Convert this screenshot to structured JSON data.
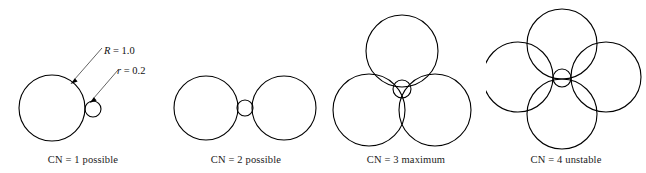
{
  "figure": {
    "background_color": "#ffffff",
    "stroke_color": "#000000",
    "leader_color": "#3c3c3c"
  },
  "annotations": {
    "radius_large": {
      "symbol": "R",
      "equals": " = 1.0",
      "full": "R = 1.0"
    },
    "radius_small": {
      "symbol": "r",
      "equals": " = 0.2",
      "full": "r = 0.2"
    }
  },
  "panels": [
    {
      "id": "cn1",
      "caption": "CN = 1 possible",
      "cn": 1,
      "status": "possible",
      "large_circles": [
        {
          "cx": 52,
          "cy": 108,
          "r": 33
        }
      ],
      "small_circles": [
        {
          "cx": 93,
          "cy": 109,
          "r": 8
        }
      ]
    },
    {
      "id": "cn2",
      "caption": "CN = 2 possible",
      "cn": 2,
      "status": "possible",
      "large_circles": [
        {
          "cx": 206,
          "cy": 108,
          "r": 32
        },
        {
          "cx": 284,
          "cy": 108,
          "r": 32
        }
      ],
      "small_circles": [
        {
          "cx": 245,
          "cy": 108,
          "r": 8
        }
      ]
    },
    {
      "id": "cn3",
      "caption": "CN = 3 maximum",
      "cn": 3,
      "status": "maximum",
      "large_circles": [
        {
          "cx": 402,
          "cy": 51,
          "r": 36
        },
        {
          "cx": 369,
          "cy": 110,
          "r": 36
        },
        {
          "cx": 435,
          "cy": 110,
          "r": 36
        }
      ],
      "small_circles": [
        {
          "cx": 402,
          "cy": 89,
          "r": 9
        }
      ]
    },
    {
      "id": "cn4",
      "caption": "CN = 4 unstable",
      "cn": 4,
      "status": "unstable",
      "large_circles": [
        {
          "cx": 562,
          "cy": 44,
          "r": 35
        },
        {
          "cx": 518,
          "cy": 77,
          "r": 35
        },
        {
          "cx": 606,
          "cy": 77,
          "r": 35
        },
        {
          "cx": 562,
          "cy": 114,
          "r": 35
        }
      ],
      "small_circles": [
        {
          "cx": 562,
          "cy": 78,
          "r": 9
        }
      ]
    }
  ]
}
